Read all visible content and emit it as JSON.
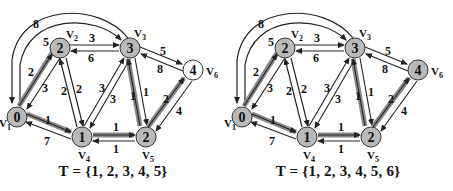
{
  "colors": {
    "node_visited": "#b9b9b9",
    "node_unvisited": "#ffffff",
    "node_stroke": "#333333",
    "edge": "#222222",
    "tree_edge": "#7a7a7a",
    "text": "#111111"
  },
  "graphs": [
    {
      "caption": "T = {1, 2, 3, 4, 5}",
      "nodes": [
        {
          "id": "v1",
          "label": "V",
          "sub": "1",
          "dist": "0",
          "visited": true
        },
        {
          "id": "v2",
          "label": "V",
          "sub": "2",
          "dist": "2",
          "visited": true
        },
        {
          "id": "v3",
          "label": "V",
          "sub": "3",
          "dist": "3",
          "visited": true
        },
        {
          "id": "v4",
          "label": "V",
          "sub": "4",
          "dist": "1",
          "visited": true
        },
        {
          "id": "v5",
          "label": "V",
          "sub": "5",
          "dist": "2",
          "visited": true
        },
        {
          "id": "v6",
          "label": "V",
          "sub": "6",
          "dist": "4",
          "visited": false
        }
      ]
    },
    {
      "caption": "T = {1, 2, 3, 4, 5, 6}",
      "nodes": [
        {
          "id": "v1",
          "label": "V",
          "sub": "1",
          "dist": "0",
          "visited": true
        },
        {
          "id": "v2",
          "label": "V",
          "sub": "2",
          "dist": "2",
          "visited": true
        },
        {
          "id": "v3",
          "label": "V",
          "sub": "3",
          "dist": "3",
          "visited": true
        },
        {
          "id": "v4",
          "label": "V",
          "sub": "4",
          "dist": "1",
          "visited": true
        },
        {
          "id": "v5",
          "label": "V",
          "sub": "5",
          "dist": "2",
          "visited": true
        },
        {
          "id": "v6",
          "label": "V",
          "sub": "6",
          "dist": "4",
          "visited": true
        }
      ]
    }
  ],
  "edges": [
    {
      "from": "v1",
      "to": "v2",
      "weight": "2",
      "tree": true
    },
    {
      "from": "v2",
      "to": "v1",
      "weight": "3",
      "tree": false
    },
    {
      "from": "v1",
      "to": "v4",
      "weight": "1",
      "tree": true
    },
    {
      "from": "v4",
      "to": "v1",
      "weight": "7",
      "tree": false
    },
    {
      "from": "v1",
      "to": "v3",
      "weight": "5",
      "tree": false
    },
    {
      "from": "v3",
      "to": "v1",
      "weight": "8",
      "tree": false
    },
    {
      "from": "v2",
      "to": "v3",
      "weight": "3",
      "tree": false
    },
    {
      "from": "v3",
      "to": "v2",
      "weight": "6",
      "tree": false
    },
    {
      "from": "v2",
      "to": "v4",
      "weight": "2",
      "tree": false
    },
    {
      "from": "v4",
      "to": "v2",
      "weight": "2",
      "tree": false
    },
    {
      "from": "v4",
      "to": "v3",
      "weight": "3",
      "tree": false
    },
    {
      "from": "v3",
      "to": "v4",
      "weight": "3",
      "tree": false
    },
    {
      "from": "v4",
      "to": "v5",
      "weight": "1",
      "tree": true
    },
    {
      "from": "v5",
      "to": "v4",
      "weight": "1",
      "tree": false
    },
    {
      "from": "v3",
      "to": "v5",
      "weight": "1",
      "tree": false
    },
    {
      "from": "v5",
      "to": "v3",
      "weight": "1",
      "tree": true
    },
    {
      "from": "v3",
      "to": "v6",
      "weight": "5",
      "tree": false
    },
    {
      "from": "v6",
      "to": "v3",
      "weight": "8",
      "tree": false
    },
    {
      "from": "v5",
      "to": "v6",
      "weight": "2",
      "tree": true
    },
    {
      "from": "v6",
      "to": "v5",
      "weight": "4",
      "tree": false
    }
  ]
}
